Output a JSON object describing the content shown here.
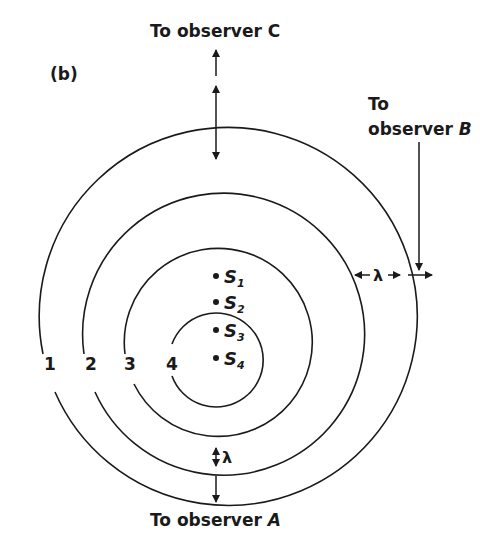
{
  "figure": {
    "panel_label": "(b)",
    "observers": {
      "top": {
        "line1": "To observer ",
        "name": "C"
      },
      "right": {
        "line1": "To",
        "line2": "observer ",
        "name": "B"
      },
      "bottom": {
        "line1": "To observer ",
        "name": "A"
      }
    },
    "wavelength_symbol": "λ",
    "wavefronts": [
      {
        "label": "1",
        "cx": 215,
        "cy": 276,
        "r": 189
      },
      {
        "label": "2",
        "cx": 216,
        "cy": 303,
        "r": 141
      },
      {
        "label": "3",
        "cx": 216,
        "cy": 331,
        "r": 94
      },
      {
        "label": "4",
        "cx": 216,
        "cy": 360,
        "r": 47
      }
    ],
    "sources": [
      {
        "name": "S",
        "sub": "1",
        "x": 216,
        "y": 276
      },
      {
        "name": "S",
        "sub": "2",
        "x": 216,
        "y": 302
      },
      {
        "name": "S",
        "sub": "3",
        "x": 216,
        "y": 330
      },
      {
        "name": "S",
        "sub": "4",
        "x": 216,
        "y": 358
      }
    ],
    "colors": {
      "ink": "#1a1a1a",
      "background": "#ffffff"
    }
  }
}
